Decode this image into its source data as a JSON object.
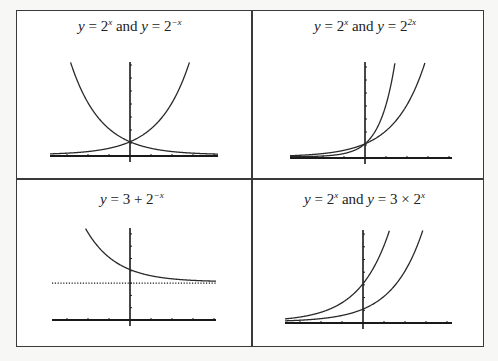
{
  "chart_data": [
    {
      "type": "line",
      "title": "y = 2^x and y = 2^-x",
      "title_parts": {
        "lhs1": "y",
        "eq1": " = 2",
        "exp1": "x",
        "mid": " and ",
        "lhs2": "y",
        "eq2": " = 2",
        "exp2": "−x"
      },
      "xlabel": "",
      "ylabel": "",
      "xlim": [
        -3.8,
        4.2
      ],
      "ylim": [
        0,
        7.2
      ],
      "series": [
        {
          "name": "y = 2^x",
          "x": [
            -3.8,
            -3,
            -2,
            -1,
            0,
            1,
            2,
            2.85
          ],
          "values": [
            0.07,
            0.125,
            0.25,
            0.5,
            1,
            2,
            4,
            7.2
          ]
        },
        {
          "name": "y = 2^-x",
          "x": [
            -2.85,
            -2,
            -1,
            0,
            1,
            2,
            3,
            4.2
          ],
          "values": [
            7.2,
            4,
            2,
            1,
            0.5,
            0.25,
            0.125,
            0.05
          ]
        }
      ],
      "intersection": {
        "x": 0,
        "y": 1
      },
      "grid": false,
      "legend": "none"
    },
    {
      "type": "line",
      "title": "y = 2^x and y = 2^2x",
      "title_parts": {
        "lhs1": "y",
        "eq1": " = 2",
        "exp1": "x",
        "mid": " and ",
        "lhs2": "y",
        "eq2": " = 2",
        "exp2": "2x"
      },
      "xlabel": "",
      "ylabel": "",
      "xlim": [
        -3.5,
        4
      ],
      "ylim": [
        0,
        6.5
      ],
      "series": [
        {
          "name": "y = 2^x",
          "x": [
            -3.5,
            -2,
            -1,
            0,
            1,
            2,
            2.7
          ],
          "values": [
            0.09,
            0.25,
            0.5,
            1,
            2,
            4,
            6.5
          ]
        },
        {
          "name": "y = 2^2x",
          "x": [
            -3.5,
            -2,
            -1,
            0,
            0.5,
            1,
            1.35
          ],
          "values": [
            0.008,
            0.0625,
            0.25,
            1,
            2,
            4,
            6.5
          ]
        }
      ],
      "intersection": {
        "x": 0,
        "y": 1
      },
      "grid": false,
      "legend": "none"
    },
    {
      "type": "line",
      "title": "y = 3 + 2^-x",
      "title_parts": {
        "lhs1": "y",
        "eq1": " = 3 + 2",
        "exp1": "−x"
      },
      "xlabel": "",
      "ylabel": "",
      "xlim": [
        -3.7,
        4.1
      ],
      "ylim": [
        0,
        7.5
      ],
      "series": [
        {
          "name": "y = 3 + 2^-x",
          "x": [
            -2.1,
            -2,
            -1,
            0,
            1,
            2,
            3,
            4.1
          ],
          "values": [
            7.3,
            7,
            5,
            4,
            3.5,
            3.25,
            3.125,
            3.06
          ]
        },
        {
          "name": "asymptote y = 3",
          "style": "dotted",
          "x": [
            -3.7,
            4.1
          ],
          "values": [
            3,
            3
          ]
        }
      ],
      "grid": false,
      "legend": "none"
    },
    {
      "type": "line",
      "title": "y = 2^x and y = 3 × 2^x",
      "title_parts": {
        "lhs1": "y",
        "eq1": " = 2",
        "exp1": "x",
        "mid": " and ",
        "lhs2": "y",
        "eq2": " = 3 × 2",
        "exp2": "x"
      },
      "xlabel": "",
      "ylabel": "",
      "xlim": [
        -3.7,
        4.2
      ],
      "ylim": [
        0,
        7.2
      ],
      "series": [
        {
          "name": "y = 2^x",
          "x": [
            -3.7,
            -2,
            -1,
            0,
            1,
            2,
            2.85
          ],
          "values": [
            0.08,
            0.25,
            0.5,
            1,
            2,
            4,
            7.2
          ]
        },
        {
          "name": "y = 3 × 2^x",
          "x": [
            -3.7,
            -2,
            -1,
            0,
            1,
            1.26
          ],
          "values": [
            0.23,
            0.75,
            1.5,
            3,
            6,
            7.2
          ]
        }
      ],
      "grid": false,
      "legend": "none"
    }
  ],
  "panels": [
    {
      "id": "tl",
      "ox": 130,
      "oy": 156,
      "ux": 21,
      "uy": 13,
      "xmin": 50,
      "xmax": 218,
      "ytop": 62,
      "xticks": [
        -3,
        -2,
        -1,
        1,
        2,
        3,
        4
      ],
      "yticks": [
        1,
        2,
        3,
        4,
        5,
        6,
        7
      ]
    },
    {
      "id": "tr",
      "ox": 365,
      "oy": 158,
      "ux": 21,
      "uy": 13,
      "xmin": 290,
      "xmax": 452,
      "ytop": 62,
      "xticks": [
        -3,
        -2,
        -1,
        1,
        2,
        3,
        4
      ],
      "yticks": [
        1,
        2,
        3,
        4,
        5,
        6,
        7
      ]
    },
    {
      "id": "bl",
      "ox": 130,
      "oy": 320,
      "ux": 21,
      "uy": 12.3,
      "xmin": 52,
      "xmax": 216,
      "ytop": 228,
      "xticks": [
        -3,
        -2,
        -1,
        1,
        2,
        3,
        4
      ],
      "yticks": [
        1,
        2,
        3,
        4,
        5,
        6,
        7
      ]
    },
    {
      "id": "br",
      "ox": 363,
      "oy": 323,
      "ux": 21,
      "uy": 12.7,
      "xmin": 285,
      "xmax": 452,
      "ytop": 230,
      "xticks": [
        -3,
        -2,
        -1,
        1,
        2,
        3,
        4
      ],
      "yticks": [
        1,
        2,
        3,
        4,
        5,
        6,
        7
      ]
    }
  ],
  "colors": {
    "curve": "#2a2a2a",
    "axis": "#1a1a1a",
    "border": "#3a3a3a",
    "background": "#ffffff"
  }
}
